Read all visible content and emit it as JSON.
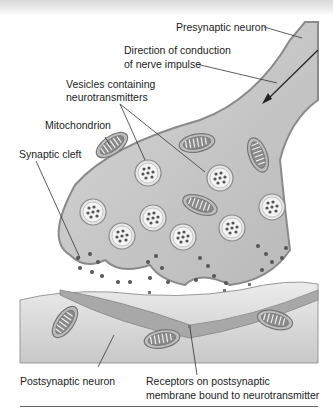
{
  "figure": {
    "labels": {
      "presynaptic_neuron": "Presynaptic neuron",
      "direction_line1": "Direction of conduction",
      "direction_line2": "of nerve impulse",
      "vesicles_line1": "Vesicles containing",
      "vesicles_line2": "neurotransmitters",
      "mitochondrion": "Mitochondrion",
      "synaptic_cleft": "Synaptic cleft",
      "postsynaptic_neuron": "Postsynaptic neuron",
      "receptors_line1": "Receptors on postsynaptic",
      "receptors_line2": "membrane bound to neurotransmitter"
    },
    "colors": {
      "cytoplasm": "#c8c8c8",
      "membrane": "#9a9a9a",
      "vesicle_fill": "#eeeeee",
      "neurotransmitter": "#555555",
      "postsynaptic": "#e0e0e0",
      "receptor_band": "#a8a8a8",
      "text": "#222222"
    }
  }
}
